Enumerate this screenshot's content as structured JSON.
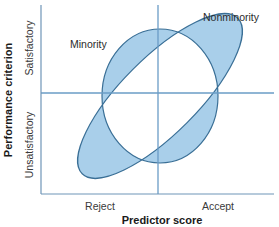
{
  "diagram": {
    "x_axis": {
      "title": "Predictor score",
      "tick_labels": [
        "Reject",
        "Accept"
      ]
    },
    "y_axis": {
      "title": "Performance criterion",
      "tick_labels": [
        "Unsatisfactory",
        "Satisfactory"
      ]
    },
    "groups": [
      {
        "name": "Minority",
        "shape": "near-circular ellipse",
        "label": "Minority"
      },
      {
        "name": "Nonminority",
        "shape": "tilted elongated ellipse",
        "label": "Nonminority"
      }
    ],
    "cutoffs": {
      "predictor_cutoff": "vertical line dividing Reject / Accept",
      "criterion_cutoff": "horizontal line dividing Unsatisfactory / Satisfactory"
    },
    "colors": {
      "fill": "#a9cfea",
      "stroke": "#3a6f96",
      "axis": "#6f95b8",
      "cutoff_line": "#6a9cc6"
    }
  }
}
